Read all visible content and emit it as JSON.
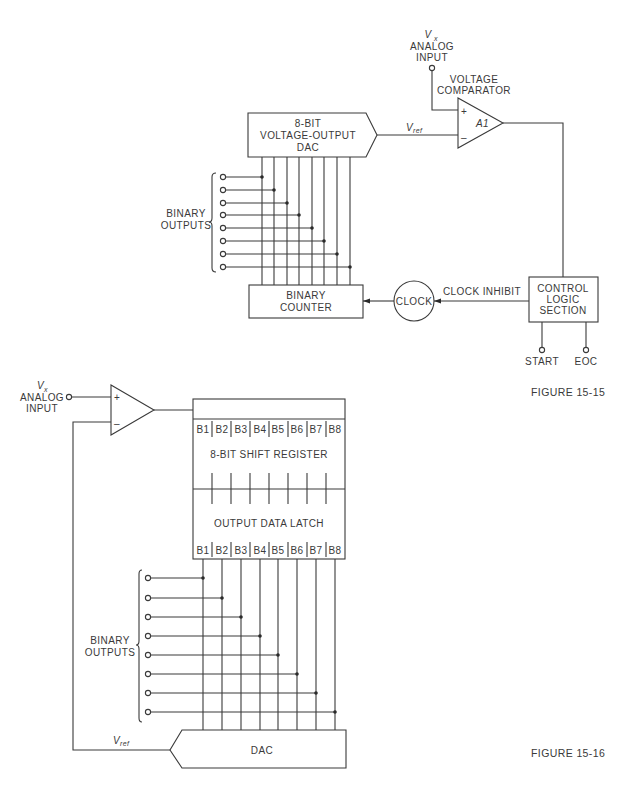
{
  "figure_15_15": {
    "caption": "FIGURE 15-15",
    "analog_input": {
      "symbol": "V",
      "subscript": "x",
      "label_line1": "ANALOG",
      "label_line2": "INPUT"
    },
    "comparator": {
      "title_line1": "VOLTAGE",
      "title_line2": "COMPARATOR",
      "name": "A1",
      "plus": "+",
      "minus": "–"
    },
    "dac": {
      "line1": "8-BIT",
      "line2": "VOLTAGE-OUTPUT",
      "line3": "DAC"
    },
    "vref": {
      "symbol": "V",
      "subscript": "ref"
    },
    "binary_outputs": {
      "line1": "BINARY",
      "line2": "OUTPUTS",
      "count": 8
    },
    "counter": {
      "line1": "BINARY",
      "line2": "COUNTER"
    },
    "clock": {
      "label": "CLOCK"
    },
    "clock_inhibit": {
      "label": "CLOCK INHIBIT"
    },
    "control": {
      "line1": "CONTROL",
      "line2": "LOGIC",
      "line3": "SECTION"
    },
    "start": {
      "label": "START"
    },
    "eoc": {
      "label": "EOC"
    }
  },
  "figure_15_16": {
    "caption": "FIGURE 15-16",
    "analog_input": {
      "symbol": "V",
      "subscript": "x",
      "label_line1": "ANALOG",
      "label_line2": "INPUT"
    },
    "comparator": {
      "plus": "+",
      "minus": "–"
    },
    "shift_register": {
      "label": "8-BIT SHIFT REGISTER",
      "bits": [
        "B1",
        "B2",
        "B3",
        "B4",
        "B5",
        "B6",
        "B7",
        "B8"
      ]
    },
    "latch": {
      "label": "OUTPUT DATA LATCH",
      "bits": [
        "B1",
        "B2",
        "B3",
        "B4",
        "B5",
        "B6",
        "B7",
        "B8"
      ]
    },
    "binary_outputs": {
      "line1": "BINARY",
      "line2": "OUTPUTS",
      "count": 8
    },
    "dac": {
      "label": "DAC"
    },
    "vref": {
      "symbol": "V",
      "subscript": "ref"
    }
  }
}
